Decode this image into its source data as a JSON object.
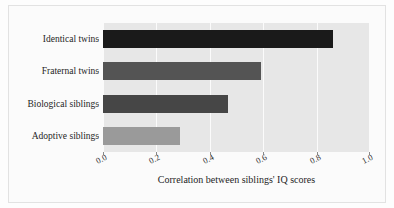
{
  "chart_data": {
    "type": "bar",
    "orientation": "horizontal",
    "title": "",
    "subtitle": "",
    "xlabel": "Correlation between siblings' IQ scores",
    "ylabel": "",
    "categories": [
      "Identical twins",
      "Fraternal twins",
      "Biological siblings",
      "Adoptive siblings"
    ],
    "values": [
      0.86,
      0.59,
      0.47,
      0.29
    ],
    "bar_colors": [
      "#1a1a1a",
      "#545454",
      "#464646",
      "#9a9a9a"
    ],
    "xlim": [
      0.0,
      1.0
    ],
    "xticks": [
      0.0,
      0.2,
      0.4,
      0.6,
      0.8,
      1.0
    ],
    "xtick_labels": [
      "0.0",
      "0.2",
      "0.4",
      "0.6",
      "0.8",
      "1.0"
    ],
    "grid": "vertical-white-gridlines",
    "legend": "none",
    "panel_background": "#e7e7e7",
    "figure_background": "#fbfbfb",
    "annotations": []
  },
  "axis": {
    "x_title": "Correlation between siblings' IQ scores"
  }
}
